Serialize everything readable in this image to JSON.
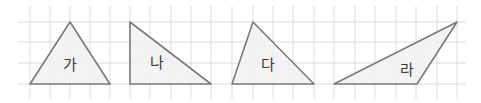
{
  "grid": {
    "x_lines": [
      30,
      50,
      70,
      90,
      110,
      130,
      150,
      171,
      191,
      211,
      232,
      253,
      273,
      293,
      314,
      334,
      355,
      375,
      396,
      416,
      437,
      457
    ],
    "y_lines": [
      22,
      42,
      63,
      84
    ],
    "x_extent": [
      18,
      466
    ],
    "y_extent": [
      6,
      99
    ],
    "color": "#dcdcdc"
  },
  "style": {
    "stroke": "#7a7a7a",
    "fill": "#f1f1f1"
  },
  "triangles": [
    {
      "label": "가",
      "points": "30,84 70,22 110,84",
      "label_pos": [
        70,
        65
      ]
    },
    {
      "label": "나",
      "points": "130,22 130,84 211,84",
      "label_pos": [
        157,
        63
      ]
    },
    {
      "label": "다",
      "points": "232,84 253,22 314,84",
      "label_pos": [
        268,
        65
      ]
    },
    {
      "label": "라",
      "points": "334,84 417,84 457,22",
      "label_pos": [
        407,
        70
      ]
    }
  ]
}
